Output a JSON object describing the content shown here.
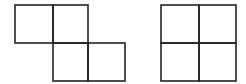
{
  "figures": [
    {
      "name": "s-tetromino-shape",
      "stroke": "#222222",
      "cells": [
        {
          "x": 15,
          "y": 5,
          "w": 38,
          "h": 38
        },
        {
          "x": 53,
          "y": 5,
          "w": 35,
          "h": 38
        },
        {
          "x": 53,
          "y": 43,
          "w": 35,
          "h": 38
        },
        {
          "x": 88,
          "y": 43,
          "w": 37,
          "h": 38
        }
      ]
    },
    {
      "name": "square-2x2-shape",
      "stroke": "#222222",
      "cells": [
        {
          "x": 161,
          "y": 5,
          "w": 38,
          "h": 38
        },
        {
          "x": 199,
          "y": 5,
          "w": 37,
          "h": 38
        },
        {
          "x": 161,
          "y": 43,
          "w": 38,
          "h": 38
        },
        {
          "x": 199,
          "y": 43,
          "w": 37,
          "h": 38
        }
      ]
    }
  ]
}
